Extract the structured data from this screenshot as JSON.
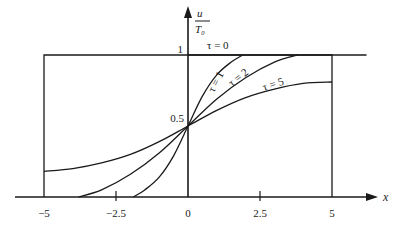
{
  "chart_data": {
    "type": "line",
    "title": "",
    "xlabel": "x",
    "ylabel_numerator": "u",
    "ylabel_denominator": "T₀",
    "xlim": [
      -5.5,
      6.5
    ],
    "ylim": [
      0,
      1.15
    ],
    "grid": false,
    "legend": "inline curve labels",
    "x_ticks": [
      {
        "value": -5,
        "label": "−5"
      },
      {
        "value": -2.5,
        "label": "−2.5"
      },
      {
        "value": 0,
        "label": "0"
      },
      {
        "value": 2.5,
        "label": "2.5"
      },
      {
        "value": 5,
        "label": "5"
      }
    ],
    "y_ticks": [
      {
        "value": 1,
        "label": "1"
      },
      {
        "value": 0.5,
        "label": "0.5"
      }
    ],
    "box": {
      "x0": -5,
      "x1": 5,
      "y0": 0,
      "y1": 1
    },
    "series": [
      {
        "name": "τ = 0",
        "label": "τ = 0",
        "points": [
          [
            0,
            1
          ],
          [
            6.2,
            1
          ]
        ]
      },
      {
        "name": "τ = 1",
        "label": "τ = 1",
        "points": [
          [
            -1.9,
            0
          ],
          [
            -1.5,
            0.05
          ],
          [
            -1.0,
            0.14
          ],
          [
            -0.5,
            0.29
          ],
          [
            0,
            0.5
          ],
          [
            0.5,
            0.71
          ],
          [
            1.0,
            0.86
          ],
          [
            1.5,
            0.95
          ],
          [
            1.9,
            1.0
          ]
        ]
      },
      {
        "name": "τ = 2",
        "label": "τ = 2",
        "points": [
          [
            -3.8,
            0
          ],
          [
            -3.0,
            0.05
          ],
          [
            -2.0,
            0.16
          ],
          [
            -1.0,
            0.31
          ],
          [
            0,
            0.5
          ],
          [
            1.0,
            0.69
          ],
          [
            2.0,
            0.84
          ],
          [
            3.0,
            0.95
          ],
          [
            3.8,
            1.0
          ]
        ]
      },
      {
        "name": "τ = 5",
        "label": "τ = 5",
        "points": [
          [
            -5,
            0.18
          ],
          [
            -4,
            0.2
          ],
          [
            -3,
            0.24
          ],
          [
            -2,
            0.3
          ],
          [
            -1,
            0.39
          ],
          [
            0,
            0.5
          ],
          [
            1,
            0.61
          ],
          [
            2,
            0.7
          ],
          [
            3,
            0.76
          ],
          [
            4,
            0.8
          ],
          [
            5,
            0.81
          ]
        ]
      }
    ],
    "annotations": [
      {
        "text": "0.5",
        "at": [
          0,
          0.5
        ]
      },
      {
        "text": "1",
        "at": [
          0,
          1
        ]
      }
    ]
  }
}
